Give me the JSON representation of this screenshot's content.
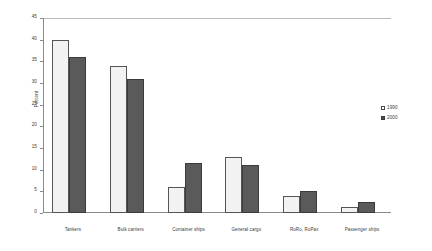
{
  "chart_data": {
    "type": "bar",
    "title": "",
    "xlabel": "",
    "ylabel": "Percent",
    "ylim": [
      0,
      45
    ],
    "ytick_step": 5,
    "yticks": [
      "0",
      "5",
      "10",
      "15",
      "20",
      "25",
      "30",
      "35",
      "40",
      "45"
    ],
    "grid": false,
    "legend_position": "right",
    "categories": [
      "Tankers",
      "Bulk carriers",
      "Container ships",
      "General cargo",
      "RoRo, RoPax",
      "Passenger ships"
    ],
    "series": [
      {
        "name": "1990",
        "color": "#f2f2f2",
        "values": [
          40,
          34,
          6,
          13,
          4,
          1.5
        ]
      },
      {
        "name": "2000",
        "color": "#5a5a5a",
        "values": [
          36,
          31,
          11.5,
          11,
          5,
          2.5
        ]
      }
    ]
  },
  "legend": {
    "items": [
      {
        "label": "1990"
      },
      {
        "label": "2000"
      }
    ]
  }
}
